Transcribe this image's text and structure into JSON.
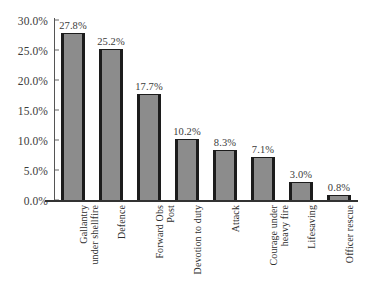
{
  "chart_data": {
    "type": "bar",
    "title": "",
    "subtitle": "",
    "xlabel": "",
    "ylabel": "",
    "ylim": [
      0,
      30
    ],
    "grid": false,
    "legend": false,
    "legend_position": "none",
    "orientation": "vertical",
    "value_suffix": "%",
    "categories": [
      "Gallantry under shellfire",
      "Defence",
      "Forward Obs Post",
      "Devotion to duty",
      "Attack",
      "Courage under heavy fire",
      "Lifesaving",
      "Officer rescue"
    ],
    "category_lines": [
      [
        "Gallantry",
        "under shellfire"
      ],
      [
        "Defence"
      ],
      [
        "Forward Obs",
        "Post"
      ],
      [
        "Devotion to duty"
      ],
      [
        "Attack"
      ],
      [
        "Courage under",
        "heavy fire"
      ],
      [
        "Lifesaving"
      ],
      [
        "Officer rescue"
      ]
    ],
    "values": [
      27.8,
      25.2,
      17.7,
      10.2,
      8.3,
      7.1,
      3.0,
      0.8
    ],
    "data_labels": [
      "27.8%",
      "25.2%",
      "17.7%",
      "10.2%",
      "8.3%",
      "7.1%",
      "3.0%",
      "0.8%"
    ],
    "y_ticks": [
      0,
      5,
      10,
      15,
      20,
      25,
      30
    ],
    "y_tick_labels": [
      "0.0%",
      "5.0%",
      "10.0%",
      "15.0%",
      "20.0%",
      "25.0%",
      "30.0%"
    ],
    "colors": {
      "bar_fill": "#8c8c8c",
      "bar_edge": "#1c1c1c",
      "axis": "#333333",
      "text": "#3b3b3b",
      "background": "#ffffff"
    }
  }
}
